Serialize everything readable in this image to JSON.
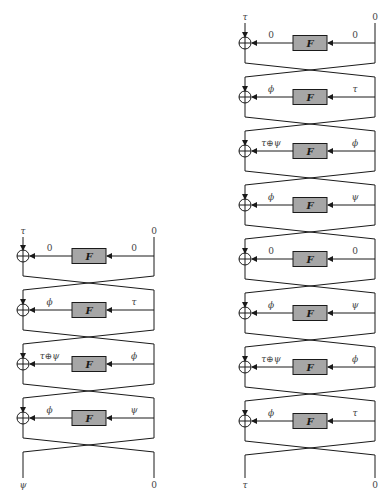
{
  "diagrams": [
    {
      "id": "left",
      "description": "4-round Feistel network",
      "xor_x": 23,
      "rail_x": 154,
      "fbox": {
        "x": 72,
        "w": 34,
        "h": 15
      },
      "top_inputs": {
        "left": "τ",
        "right": "0"
      },
      "top_label_y": 234,
      "rounds": [
        {
          "y": 256,
          "left_label": "0",
          "right_label": "0",
          "f_label": "F"
        },
        {
          "y": 310,
          "left_label": "ϕ",
          "right_label": "τ",
          "f_label": "F"
        },
        {
          "y": 364,
          "left_label": "τ⊕ψ",
          "right_label": "ϕ",
          "f_label": "F"
        },
        {
          "y": 418,
          "left_label": "ϕ",
          "right_label": "ψ",
          "f_label": "F"
        }
      ],
      "bottom_outputs": {
        "left": "ψ",
        "right": "0"
      }
    },
    {
      "id": "right",
      "description": "8-round Feistel network",
      "xor_x": 245,
      "rail_x": 375,
      "fbox": {
        "x": 293,
        "w": 34,
        "h": 15
      },
      "top_inputs": {
        "left": "τ",
        "right": "0"
      },
      "top_label_y": 20,
      "rounds": [
        {
          "y": 43,
          "left_label": "0",
          "right_label": "0",
          "f_label": "F"
        },
        {
          "y": 97,
          "left_label": "ϕ",
          "right_label": "τ",
          "f_label": "F"
        },
        {
          "y": 151,
          "left_label": "τ⊕ψ",
          "right_label": "ϕ",
          "f_label": "F"
        },
        {
          "y": 205,
          "left_label": "ϕ",
          "right_label": "ψ",
          "f_label": "F"
        },
        {
          "y": 259,
          "left_label": "0",
          "right_label": "0",
          "f_label": "F"
        },
        {
          "y": 313,
          "left_label": "ϕ",
          "right_label": "ψ",
          "f_label": "F"
        },
        {
          "y": 367,
          "left_label": "τ⊕ψ",
          "right_label": "ϕ",
          "f_label": "F"
        },
        {
          "y": 421,
          "left_label": "ϕ",
          "right_label": "τ",
          "f_label": "F"
        }
      ],
      "bottom_outputs": {
        "left": "τ",
        "right": "0"
      }
    }
  ],
  "bottom_label_y": 488,
  "colors": {
    "line": "#1a1a1a",
    "fbox_fill": "#a6a6a6",
    "label": "#444444"
  }
}
